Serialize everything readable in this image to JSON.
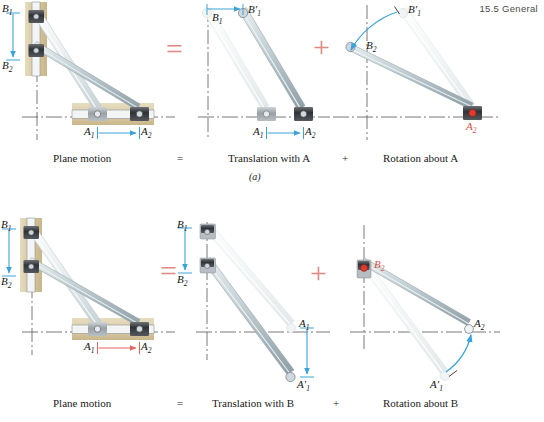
{
  "page": {
    "running_head": "15.5  General"
  },
  "figure": {
    "sub_caption": "(a)",
    "rows": [
      {
        "id": "row-a",
        "captions": {
          "plane_motion": "Plane motion",
          "equals": "=",
          "translation": "Translation with A",
          "plus": "+",
          "rotation": "Rotation about A"
        },
        "operators": {
          "equals_symbol": "=",
          "plus_symbol": "+"
        },
        "panels": [
          {
            "id": "plane-motion-a",
            "labels": [
              {
                "name": "label-B1",
                "base": "B",
                "sub": "1",
                "prime": "",
                "color": "dark"
              },
              {
                "name": "label-B2",
                "base": "B",
                "sub": "2",
                "prime": "",
                "color": "dark"
              },
              {
                "name": "label-A1",
                "base": "A",
                "sub": "1",
                "prime": "",
                "color": "dark"
              },
              {
                "name": "label-A2",
                "base": "A",
                "sub": "2",
                "prime": "",
                "color": "dark"
              }
            ],
            "arrows": [
              {
                "name": "arrow-B1-to-B2",
                "color": "#3aa3d8",
                "direction": "down"
              },
              {
                "name": "arrow-A1-to-A2",
                "color": "#3aa3d8",
                "direction": "right"
              }
            ]
          },
          {
            "id": "translation-with-a",
            "labels": [
              {
                "name": "label-B1",
                "base": "B",
                "sub": "1",
                "prime": "",
                "color": "dark"
              },
              {
                "name": "label-B1-prime",
                "base": "B",
                "sub": "1",
                "prime": "′",
                "color": "dark"
              },
              {
                "name": "label-A1",
                "base": "A",
                "sub": "1",
                "prime": "",
                "color": "dark"
              },
              {
                "name": "label-A2",
                "base": "A",
                "sub": "2",
                "prime": "",
                "color": "dark"
              }
            ],
            "arrows": [
              {
                "name": "arrow-B1-to-B1prime",
                "color": "#3aa3d8",
                "direction": "right"
              },
              {
                "name": "arrow-A1-to-A2",
                "color": "#3aa3d8",
                "direction": "right"
              }
            ]
          },
          {
            "id": "rotation-about-a",
            "labels": [
              {
                "name": "label-B1-prime",
                "base": "B",
                "sub": "1",
                "prime": "′",
                "color": "dark"
              },
              {
                "name": "label-B2",
                "base": "B",
                "sub": "2",
                "prime": "",
                "color": "dark"
              },
              {
                "name": "label-A2-pivot",
                "base": "A",
                "sub": "2",
                "prime": "",
                "color": "red"
              }
            ],
            "arrows": [
              {
                "name": "arc-arrow-rotation",
                "color": "#3aa3d8",
                "direction": "counterclockwise"
              }
            ]
          }
        ]
      },
      {
        "id": "row-b",
        "captions": {
          "plane_motion": "Plane motion",
          "equals": "=",
          "translation": "Translation with B",
          "plus": "+",
          "rotation": "Rotation about B"
        },
        "operators": {
          "equals_symbol": "=",
          "plus_symbol": "+"
        },
        "panels": [
          {
            "id": "plane-motion-b",
            "labels": [
              {
                "name": "label-B1",
                "base": "B",
                "sub": "1",
                "prime": "",
                "color": "dark"
              },
              {
                "name": "label-B2",
                "base": "B",
                "sub": "2",
                "prime": "",
                "color": "dark"
              },
              {
                "name": "label-A1",
                "base": "A",
                "sub": "1",
                "prime": "",
                "color": "dark"
              },
              {
                "name": "label-A2",
                "base": "A",
                "sub": "2",
                "prime": "",
                "color": "dark"
              }
            ],
            "arrows": [
              {
                "name": "arrow-B1-to-B2",
                "color": "#3aa3d8",
                "direction": "down"
              },
              {
                "name": "arrow-A1-to-A2",
                "color": "#e0675e",
                "direction": "right"
              }
            ]
          },
          {
            "id": "translation-with-b",
            "labels": [
              {
                "name": "label-B1",
                "base": "B",
                "sub": "1",
                "prime": "",
                "color": "dark"
              },
              {
                "name": "label-B2",
                "base": "B",
                "sub": "2",
                "prime": "",
                "color": "dark"
              },
              {
                "name": "label-A1",
                "base": "A",
                "sub": "1",
                "prime": "",
                "color": "dark"
              },
              {
                "name": "label-A1-prime",
                "base": "A",
                "sub": "1",
                "prime": "′",
                "color": "dark"
              }
            ],
            "arrows": [
              {
                "name": "arrow-B1-to-B2",
                "color": "#3aa3d8",
                "direction": "down"
              },
              {
                "name": "arrow-A1-to-A1prime",
                "color": "#3aa3d8",
                "direction": "down"
              }
            ]
          },
          {
            "id": "rotation-about-b",
            "labels": [
              {
                "name": "label-B2-pivot",
                "base": "B",
                "sub": "2",
                "prime": "",
                "color": "red"
              },
              {
                "name": "label-A2",
                "base": "A",
                "sub": "2",
                "prime": "",
                "color": "dark"
              },
              {
                "name": "label-A1-prime",
                "base": "A",
                "sub": "1",
                "prime": "′",
                "color": "dark"
              }
            ],
            "arrows": [
              {
                "name": "arc-arrow-rotation",
                "color": "#3aa3d8",
                "direction": "counterclockwise"
              }
            ]
          }
        ]
      }
    ]
  },
  "labels": {
    "B1": "B",
    "B1_sub": "1",
    "B2": "B",
    "B2_sub": "2",
    "A1": "A",
    "A1_sub": "1",
    "A2": "A",
    "A2_sub": "2",
    "prime": "′"
  },
  "colors": {
    "accent_blue": "#3aa3d8",
    "accent_red": "#d4504a",
    "operator_red": "#e08a84",
    "wood": "#ded0ae",
    "rod_light": "#e9eef0",
    "rod_dark": "#b9c7cc",
    "collar_dark": "#3c3f42",
    "axis": "#5d5d5d"
  }
}
